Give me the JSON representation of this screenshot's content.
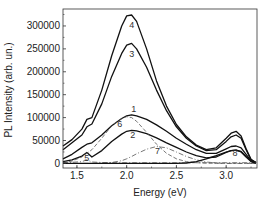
{
  "chart_data": {
    "type": "line",
    "title": "",
    "xlabel": "Energy (eV)",
    "ylabel": "PL Intensity (arb. un.)",
    "xlim": [
      1.36,
      3.31
    ],
    "ylim": [
      -10000,
      337000
    ],
    "xticks": [
      1.5,
      2.0,
      2.5,
      3.0
    ],
    "xtick_labels": [
      "1.5",
      "2.0",
      "2.5",
      "3.0"
    ],
    "yticks": [
      0,
      50000,
      100000,
      150000,
      200000,
      250000,
      300000
    ],
    "ytick_labels": [
      "0",
      "50000",
      "100000",
      "150000",
      "200000",
      "250000",
      "300000"
    ],
    "grid": false,
    "legend": "none (curves labeled inline 1-8)",
    "x": [
      1.36,
      1.45,
      1.55,
      1.6,
      1.65,
      1.75,
      1.85,
      1.95,
      2.0,
      2.05,
      2.1,
      2.2,
      2.3,
      2.4,
      2.5,
      2.6,
      2.7,
      2.8,
      2.9,
      3.0,
      3.05,
      3.1,
      3.15,
      3.2,
      3.25,
      3.3
    ],
    "series": [
      {
        "name": "1",
        "style": "solid",
        "values": [
          10000,
          20000,
          35000,
          42000,
          45000,
          62000,
          82000,
          98000,
          104000,
          106000,
          104000,
          96000,
          84000,
          70000,
          55000,
          42000,
          30000,
          22000,
          22000,
          32000,
          37000,
          38000,
          34000,
          20000,
          6000,
          2000
        ]
      },
      {
        "name": "2",
        "style": "solid",
        "values": [
          4000,
          8000,
          16000,
          24000,
          14000,
          28000,
          48000,
          64000,
          70000,
          72000,
          71000,
          65000,
          56000,
          45000,
          35000,
          25000,
          17000,
          12000,
          14000,
          24000,
          28000,
          29000,
          26000,
          15000,
          5000,
          1000
        ]
      },
      {
        "name": "3",
        "style": "solid",
        "values": [
          30000,
          45000,
          62000,
          80000,
          86000,
          130000,
          190000,
          240000,
          258000,
          262000,
          250000,
          210000,
          160000,
          115000,
          80000,
          55000,
          38000,
          28000,
          30000,
          48000,
          58000,
          62000,
          55000,
          30000,
          8000,
          2000
        ]
      },
      {
        "name": "4",
        "style": "solid",
        "values": [
          38000,
          52000,
          75000,
          96000,
          100000,
          160000,
          235000,
          300000,
          322000,
          324000,
          310000,
          250000,
          180000,
          125000,
          85000,
          58000,
          40000,
          30000,
          34000,
          55000,
          66000,
          70000,
          60000,
          32000,
          9000,
          2000
        ]
      },
      {
        "name": "5",
        "style": "dash-dot",
        "values": [
          2000,
          2500,
          4000,
          8000,
          3000,
          2000,
          1500,
          1500,
          1500,
          1500,
          1500,
          1500,
          1500,
          1500,
          1500,
          1500,
          1500,
          1500,
          1500,
          1500,
          1500,
          1500,
          1500,
          1500,
          1500,
          1500
        ]
      },
      {
        "name": "6",
        "style": "dashed",
        "values": [
          2000,
          5000,
          14000,
          22000,
          30000,
          55000,
          82000,
          98000,
          102000,
          100000,
          92000,
          68000,
          42000,
          22000,
          10000,
          4000,
          1500,
          500,
          0,
          0,
          0,
          0,
          0,
          0,
          0,
          0
        ]
      },
      {
        "name": "7",
        "style": "dash-dot",
        "values": [
          0,
          0,
          0,
          0,
          0,
          500,
          2000,
          6000,
          10000,
          15000,
          21000,
          31000,
          37000,
          34000,
          25000,
          15000,
          8000,
          3000,
          1000,
          0,
          0,
          0,
          0,
          0,
          0,
          0
        ]
      },
      {
        "name": "8",
        "style": "solid",
        "values": [
          0,
          0,
          0,
          0,
          0,
          0,
          0,
          0,
          0,
          0,
          0,
          0,
          0,
          0,
          0,
          1000,
          4000,
          10000,
          17000,
          25000,
          28000,
          29000,
          25000,
          14000,
          4000,
          0
        ]
      }
    ],
    "annotations": [
      {
        "text": "4",
        "x": 2.05,
        "y": 295000
      },
      {
        "text": "3",
        "x": 2.05,
        "y": 232000
      },
      {
        "text": "1",
        "x": 2.07,
        "y": 112000
      },
      {
        "text": "6",
        "x": 1.93,
        "y": 80000
      },
      {
        "text": "2",
        "x": 2.06,
        "y": 55000
      },
      {
        "text": "7",
        "x": 2.31,
        "y": 20000
      },
      {
        "text": "5",
        "x": 1.6,
        "y": 5000
      },
      {
        "text": "8",
        "x": 3.09,
        "y": 17000
      }
    ]
  }
}
